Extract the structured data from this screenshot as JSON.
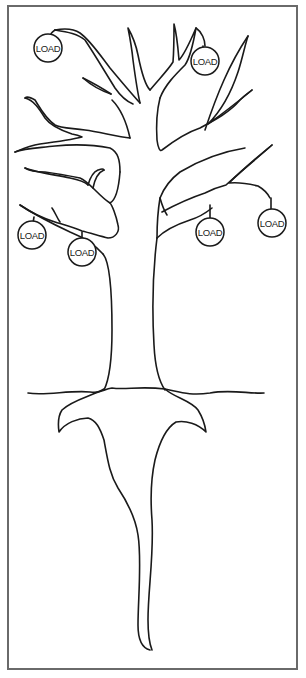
{
  "figure": {
    "type": "tree-diagram",
    "colors": {
      "line": "#1a1a1a",
      "frame": "#6a6a6a",
      "background": "#ffffff"
    }
  },
  "loads": [
    {
      "id": "load-1",
      "label": "LOAD",
      "cx": 48,
      "cy": 48
    },
    {
      "id": "load-2",
      "label": "LOAD",
      "cx": 205,
      "cy": 61
    },
    {
      "id": "load-3",
      "label": "LOAD",
      "cx": 32,
      "cy": 235
    },
    {
      "id": "load-4",
      "label": "LOAD",
      "cx": 82,
      "cy": 252
    },
    {
      "id": "load-5",
      "label": "LOAD",
      "cx": 210,
      "cy": 232
    },
    {
      "id": "load-6",
      "label": "LOAD",
      "cx": 272,
      "cy": 223
    }
  ]
}
